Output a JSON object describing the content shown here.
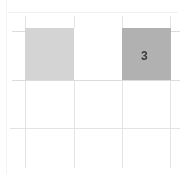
{
  "figure": {
    "name": "grid-with-shaded-cells",
    "background_color": "#ffffff",
    "width": 187,
    "height": 174
  },
  "grid": {
    "line_color": "#e3e3e3",
    "faint_line_color": "#f1f1f1",
    "strong_line_color": "#dcdcdc",
    "vertical_lines": [
      {
        "name": "vline-0",
        "x": 6,
        "tone": "faint"
      },
      {
        "name": "vline-1",
        "x": 25,
        "tone": "normal"
      },
      {
        "name": "vline-2",
        "x": 74,
        "tone": "normal"
      },
      {
        "name": "vline-3",
        "x": 122,
        "tone": "normal"
      },
      {
        "name": "vline-4",
        "x": 170,
        "tone": "normal"
      }
    ],
    "horizontal_lines": [
      {
        "name": "hline-0",
        "y": 12,
        "tone": "faint"
      },
      {
        "name": "hline-1",
        "y": 31,
        "tone": "strong"
      },
      {
        "name": "hline-2",
        "y": 80,
        "tone": "strong"
      },
      {
        "name": "hline-3",
        "y": 128,
        "tone": "normal"
      }
    ]
  },
  "cells": [
    {
      "name": "cell-left-shaded",
      "label": "",
      "fill": "#d4d4d4",
      "x": 25,
      "y": 28,
      "width": 49,
      "height": 52,
      "filled": true
    },
    {
      "name": "cell-middle-empty",
      "label": "",
      "fill": "#ffffff",
      "x": 74,
      "y": 28,
      "width": 48,
      "height": 52,
      "filled": false
    },
    {
      "name": "cell-right-shaded",
      "label": "3",
      "fill": "#b1b1b1",
      "x": 122,
      "y": 28,
      "width": 49,
      "height": 52,
      "filled": true,
      "label_color": "#3a3a3a",
      "label_x": 141,
      "label_y": 50,
      "label_font_size": 12
    }
  ]
}
